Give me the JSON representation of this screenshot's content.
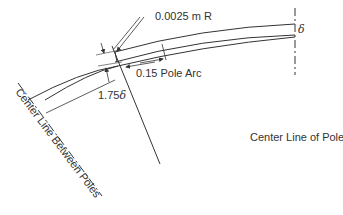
{
  "diagram": {
    "type": "pole-face air-gap geometry",
    "labels": {
      "radius_note": "0.0025 m R",
      "pole_arc": "0.15 Pole Arc",
      "edge_gap": "1.75",
      "edge_gap_symbol": "δ",
      "center_gap_symbol": "δ",
      "center_line_pole": "Center Line of Pole",
      "center_line_between_poles": "Center Line Between Poles"
    },
    "colors": {
      "line": "#333333",
      "text": "#333333",
      "background": "#ffffff"
    }
  }
}
